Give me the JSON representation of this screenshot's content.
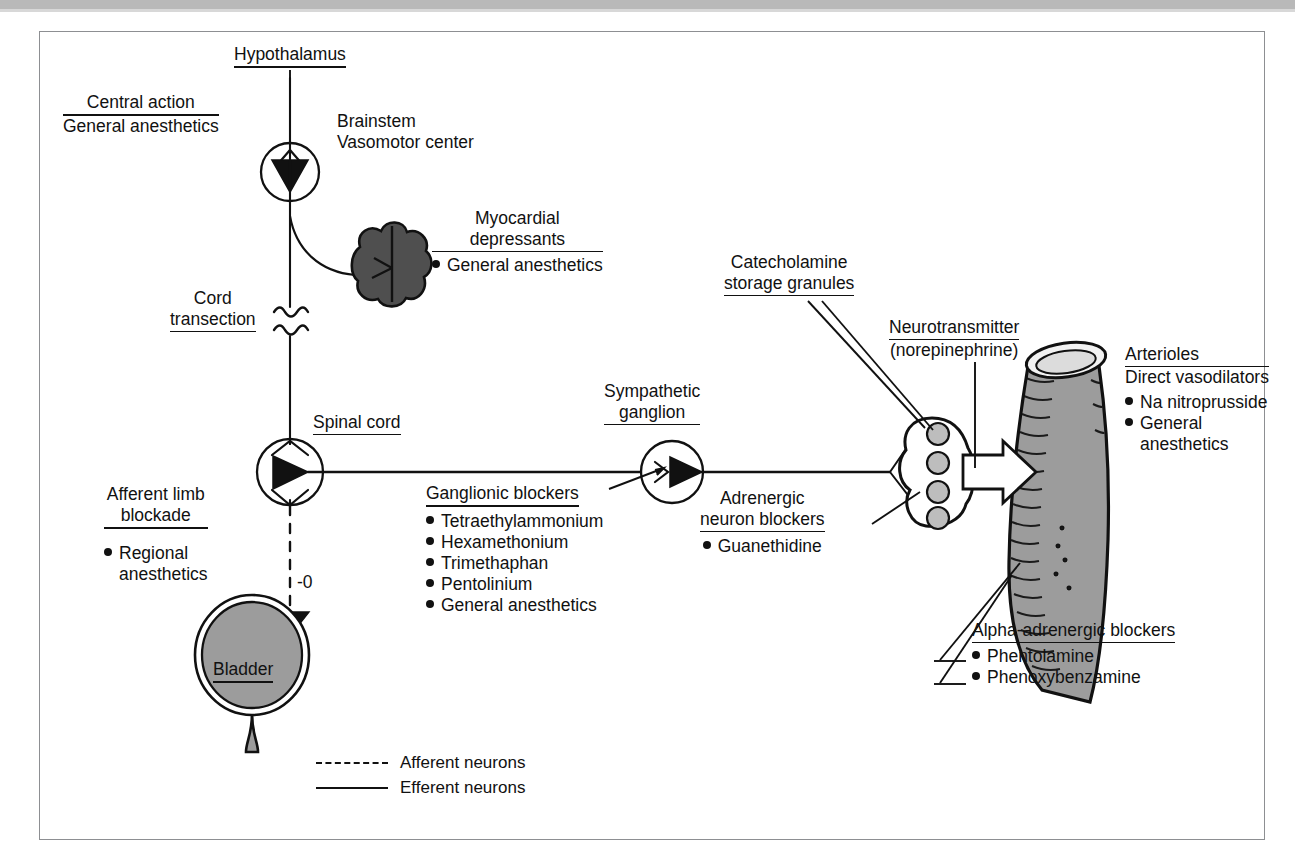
{
  "diagram": {
    "nodes": {
      "hypothalamus": "Hypothalamus",
      "brainstem_line1": "Brainstem",
      "brainstem_line2": "Vasomotor center",
      "cord_transection_line1": "Cord",
      "cord_transection_line2": "transection",
      "spinal_cord": "Spinal cord",
      "sympathetic_ganglion_line1": "Sympathetic",
      "sympathetic_ganglion_line2": "ganglion",
      "catecholamine_line1": "Catecholamine",
      "catecholamine_line2": "storage granules",
      "neurotransmitter_line1": "Neurotransmitter",
      "neurotransmitter_line2": "(norepinephrine)",
      "bladder": "Bladder",
      "afferent_marker": "-0"
    },
    "drug_groups": [
      {
        "id": "central-action",
        "heading": "Central action",
        "subheading": "General anesthetics",
        "drugs": []
      },
      {
        "id": "myocardial-depressants",
        "heading_line1": "Myocardial",
        "heading_line2": "depressants",
        "drugs": [
          "General anesthetics"
        ]
      },
      {
        "id": "afferent-limb-blockade",
        "heading_line1": "Afferent limb",
        "heading_line2": "blockade",
        "drugs": [
          "Regional",
          "anesthetics"
        ]
      },
      {
        "id": "ganglionic-blockers",
        "heading": "Ganglionic blockers",
        "drugs": [
          "Tetraethylammonium",
          "Hexamethonium",
          "Trimethaphan",
          "Pentolinium",
          "General anesthetics"
        ]
      },
      {
        "id": "adrenergic-neuron-blockers",
        "heading_line1": "Adrenergic",
        "heading_line2": "neuron blockers",
        "drugs": [
          "Guanethidine"
        ]
      },
      {
        "id": "direct-vasodilators",
        "heading": "Arterioles",
        "subheading": "Direct vasodilators",
        "drugs": [
          "Na nitroprusside",
          "General",
          "anesthetics"
        ]
      },
      {
        "id": "alpha-adrenergic-blockers",
        "heading": "Alpha-adrenergic blockers",
        "drugs": [
          "Phentolamine",
          "Phenoxybenzamine"
        ]
      }
    ],
    "legend": [
      {
        "style": "dashed",
        "label": "Afferent neurons"
      },
      {
        "style": "solid",
        "label": "Efferent neurons"
      }
    ],
    "colors": {
      "ink": "#111111",
      "frame": "#8d8f92",
      "heart_fill": "#4f4f4f",
      "bladder_fill": "#9c9c9c",
      "vessel_fill": "#9d9d9d",
      "granule_fill": "#bdbdbd",
      "paper": "#ffffff"
    }
  }
}
